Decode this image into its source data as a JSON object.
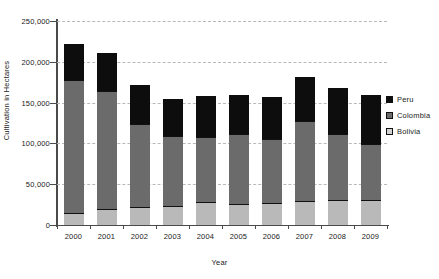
{
  "chart_data": {
    "type": "bar",
    "stacked": true,
    "title": "",
    "xlabel": "Year",
    "ylabel": "Cultivation in Hectares",
    "categories": [
      "2000",
      "2001",
      "2002",
      "2003",
      "2004",
      "2005",
      "2006",
      "2007",
      "2008",
      "2009"
    ],
    "series": [
      {
        "name": "Bolivia",
        "color": "#d2d2d2",
        "values": [
          14600,
          19900,
          21600,
          23600,
          27700,
          25400,
          27500,
          28900,
          30500,
          30900
        ]
      },
      {
        "name": "Colombia",
        "color": "#6b6b6b",
        "values": [
          163400,
          144900,
          102100,
          86100,
          80100,
          86000,
          78000,
          99000,
          81000,
          68000
        ]
      },
      {
        "name": "Peru",
        "color": "#0d0d0d",
        "values": [
          43800,
          46500,
          48300,
          44200,
          50300,
          48200,
          51400,
          53700,
          56100,
          59900
        ]
      }
    ],
    "totals": [
      221800,
      211300,
      172000,
      153900,
      158100,
      159600,
      156900,
      181600,
      167600,
      158800
    ],
    "ylim": [
      0,
      250000
    ],
    "yticks": [
      0,
      50000,
      100000,
      150000,
      200000,
      250000
    ],
    "ytick_labels": [
      "0",
      "50,000",
      "100,000",
      "150,000",
      "200,000",
      "250,000"
    ],
    "grid": true,
    "legend_position": "right",
    "legend_entries": [
      "Peru",
      "Colombia",
      "Bolivia"
    ]
  }
}
